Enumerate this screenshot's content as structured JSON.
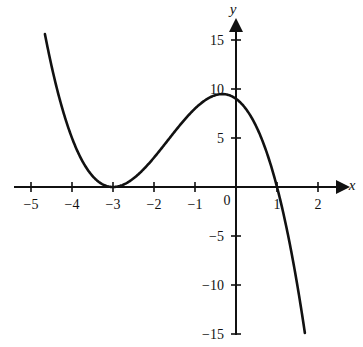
{
  "chart_data": {
    "type": "line",
    "title": "",
    "subtitle": "",
    "xlabel": "x",
    "ylabel": "y",
    "grid": false,
    "legend": null,
    "legend_position": "none",
    "xlim": [
      -5.45,
      2.35
    ],
    "ylim": [
      -16.0,
      16.3
    ],
    "x_ticks": [
      -5,
      -4,
      -3,
      -2,
      -1,
      0,
      1,
      2
    ],
    "x_tick_labels": [
      "−5",
      "−4",
      "−3",
      "−2",
      "−1",
      "0",
      "1",
      "2"
    ],
    "y_ticks": [
      -15,
      -10,
      -5,
      5,
      10,
      15
    ],
    "y_tick_labels": [
      "−15",
      "−10",
      "−5",
      "5",
      "10",
      "15"
    ],
    "series": [
      {
        "name": "y = (x+3)^2(1-x)",
        "color": "#111111",
        "x_domain": [
          -4.66,
          1.68
        ],
        "x": [
          -4.66,
          -4.5,
          -4.25,
          -4.0,
          -3.75,
          -3.5,
          -3.25,
          -3.0,
          -2.75,
          -2.5,
          -2.25,
          -2.0,
          -1.75,
          -1.5,
          -1.25,
          -1.0,
          -0.75,
          -0.5,
          -0.3333,
          -0.25,
          0.0,
          0.25,
          0.5,
          0.75,
          1.0,
          1.25,
          1.5,
          1.68
        ],
        "y": [
          15.63,
          12.83,
          7.81,
          5.0,
          2.53,
          1.13,
          0.34,
          0.0,
          0.23,
          0.88,
          1.83,
          3.0,
          4.3,
          5.63,
          6.89,
          8.0,
          8.86,
          9.38,
          9.48,
          9.45,
          9.0,
          7.9,
          6.13,
          3.69,
          0.0,
          -5.74,
          -12.38,
          -16.43
        ]
      }
    ],
    "annotations": [
      {
        "name": "tangent-minimum",
        "x": -3,
        "y": 0
      },
      {
        "name": "local-maximum",
        "x": -0.3333,
        "y": 9.48
      },
      {
        "name": "y-intercept",
        "x": 0,
        "y": 9
      },
      {
        "name": "x-intercept",
        "x": 1,
        "y": 0
      }
    ]
  },
  "axes": {
    "x_axis_label": "x",
    "y_axis_label": "y"
  }
}
